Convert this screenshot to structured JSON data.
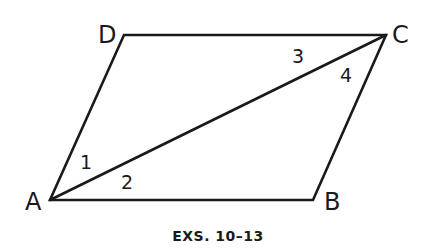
{
  "figure": {
    "caption": "EXS. 10–13",
    "stroke_color": "#1a1a1a",
    "background": "#ffffff"
  },
  "vertices": {
    "A": {
      "label": "A",
      "x": 50,
      "y": 200
    },
    "B": {
      "label": "B",
      "x": 313,
      "y": 200
    },
    "C": {
      "label": "C",
      "x": 386,
      "y": 35
    },
    "D": {
      "label": "D",
      "x": 124,
      "y": 35
    }
  },
  "segments": [
    {
      "from": "A",
      "to": "B"
    },
    {
      "from": "B",
      "to": "C"
    },
    {
      "from": "C",
      "to": "D"
    },
    {
      "from": "D",
      "to": "A"
    },
    {
      "from": "A",
      "to": "C",
      "type": "diagonal"
    }
  ],
  "angles": [
    {
      "label": "1",
      "vertex": "A",
      "between": [
        "AD",
        "AC"
      ]
    },
    {
      "label": "2",
      "vertex": "A",
      "between": [
        "AC",
        "AB"
      ]
    },
    {
      "label": "3",
      "vertex": "C",
      "between": [
        "CD",
        "CA"
      ]
    },
    {
      "label": "4",
      "vertex": "C",
      "between": [
        "CA",
        "CB"
      ]
    }
  ]
}
